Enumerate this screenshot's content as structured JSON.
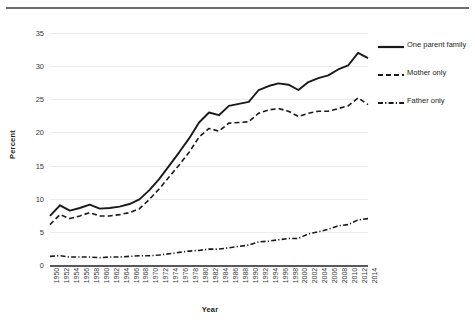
{
  "chart_data": {
    "type": "line",
    "title": "",
    "xlabel": "Year",
    "ylabel": "Percent",
    "ylim": [
      0,
      35
    ],
    "ytick_step": 5,
    "yticks": [
      0,
      5,
      10,
      15,
      20,
      25,
      30,
      35
    ],
    "xlim": [
      1950,
      2014
    ],
    "grid": "horizontal",
    "legend_position": "right",
    "categories": [
      1950,
      1952,
      1954,
      1956,
      1958,
      1960,
      1962,
      1964,
      1966,
      1968,
      1970,
      1972,
      1974,
      1976,
      1978,
      1980,
      1982,
      1984,
      1986,
      1988,
      1990,
      1992,
      1994,
      1996,
      1998,
      2000,
      2002,
      2004,
      2006,
      2008,
      2010,
      2012,
      2014
    ],
    "series": [
      {
        "name": "One parent family",
        "style": "solid",
        "color": "#1a1a1a",
        "values": [
          7.4,
          9.0,
          8.2,
          8.6,
          9.1,
          8.5,
          8.6,
          8.8,
          9.2,
          9.9,
          11.3,
          13.0,
          15.0,
          17.0,
          19.1,
          21.5,
          23.0,
          22.6,
          24.0,
          24.3,
          24.6,
          26.4,
          27.0,
          27.4,
          27.2,
          26.4,
          27.6,
          28.2,
          28.6,
          29.5,
          30.1,
          32.0,
          31.2
        ]
      },
      {
        "name": "Mother only",
        "style": "dashed",
        "color": "#1a1a1a",
        "values": [
          6.1,
          7.6,
          7.0,
          7.4,
          7.9,
          7.4,
          7.4,
          7.6,
          7.9,
          8.5,
          9.9,
          11.5,
          13.3,
          15.1,
          17.0,
          19.3,
          20.6,
          20.2,
          21.4,
          21.5,
          21.6,
          22.9,
          23.4,
          23.6,
          23.2,
          22.4,
          22.9,
          23.2,
          23.2,
          23.6,
          24.0,
          25.2,
          24.2
        ]
      },
      {
        "name": "Father only",
        "style": "dashdot",
        "color": "#1a1a1a",
        "values": [
          1.3,
          1.4,
          1.2,
          1.2,
          1.2,
          1.1,
          1.2,
          1.2,
          1.3,
          1.4,
          1.4,
          1.5,
          1.7,
          1.9,
          2.1,
          2.2,
          2.4,
          2.4,
          2.6,
          2.8,
          3.0,
          3.5,
          3.6,
          3.8,
          4.0,
          4.0,
          4.7,
          5.0,
          5.4,
          5.9,
          6.1,
          6.8,
          7.0
        ]
      }
    ]
  },
  "legend": {
    "items": [
      {
        "label": "One parent family",
        "style": "solid"
      },
      {
        "label": "Mother only",
        "style": "dashed"
      },
      {
        "label": "Father only",
        "style": "dashdot"
      }
    ]
  },
  "axes": {
    "y_title": "Percent",
    "x_title": "Year"
  }
}
